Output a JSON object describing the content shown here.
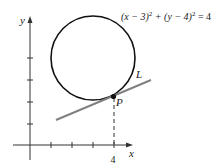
{
  "diagram": {
    "equation": {
      "prefix": "(x − 3)",
      "exp1": "2",
      "mid": " + (y − 4)",
      "exp2": "2",
      "suffix": " = 4"
    },
    "axes": {
      "x_label": "x",
      "y_label": "y",
      "x_tick_label": "4"
    },
    "labels": {
      "line": "L",
      "point": "P"
    },
    "circle": {
      "center": [
        3,
        4
      ],
      "radius": 2
    },
    "point_P": [
      4,
      2.268
    ],
    "colors": {
      "curve": "#111111",
      "tangent_line": "#808080",
      "axes": "#333333"
    }
  }
}
